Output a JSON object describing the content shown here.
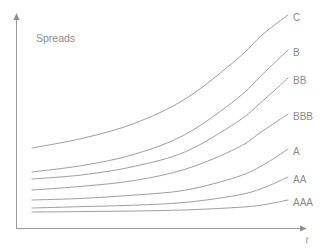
{
  "figure": {
    "title": "Spreads",
    "background_color": "#ffffff",
    "line_color": "#9e9e9e",
    "text_color": "#8b8b8b",
    "axis_color": "#9a9a9a"
  },
  "axes": {
    "x_label": "t",
    "y_label": "Spreads",
    "x_arrow": true,
    "y_arrow": true,
    "ticks": false,
    "grid": false
  },
  "chart_data": {
    "type": "line",
    "title": "Spreads",
    "xlabel": "t",
    "ylabel": "Spreads",
    "xlim": [
      0,
      1
    ],
    "ylim": [
      0,
      1
    ],
    "grid": false,
    "legend": "inline-right-labels",
    "note": "Credit spread term structures by rating; spread increases with maturity t, steeply for low ratings.",
    "series": [
      {
        "name": "C",
        "label": "C",
        "x": [
          0.0,
          0.2,
          0.4,
          0.6,
          0.8,
          0.9,
          1.0
        ],
        "y": [
          0.46,
          0.5,
          0.56,
          0.66,
          0.82,
          0.92,
          1.0
        ]
      },
      {
        "name": "B",
        "label": "B",
        "x": [
          0.0,
          0.2,
          0.4,
          0.6,
          0.8,
          0.9,
          1.0
        ],
        "y": [
          0.3,
          0.33,
          0.38,
          0.47,
          0.63,
          0.74,
          0.85
        ]
      },
      {
        "name": "BB",
        "label": "BB",
        "x": [
          0.0,
          0.2,
          0.4,
          0.6,
          0.8,
          0.9,
          1.0
        ],
        "y": [
          0.25,
          0.27,
          0.31,
          0.38,
          0.52,
          0.62,
          0.73
        ]
      },
      {
        "name": "BBB",
        "label": "BBB",
        "x": [
          0.0,
          0.2,
          0.4,
          0.6,
          0.8,
          0.9,
          1.0
        ],
        "y": [
          0.21,
          0.23,
          0.26,
          0.32,
          0.43,
          0.52,
          0.61
        ]
      },
      {
        "name": "A",
        "label": "A",
        "x": [
          0.0,
          0.2,
          0.4,
          0.6,
          0.8,
          0.9,
          1.0
        ],
        "y": [
          0.13,
          0.14,
          0.16,
          0.19,
          0.27,
          0.34,
          0.44
        ]
      },
      {
        "name": "AA",
        "label": "AA",
        "x": [
          0.0,
          0.2,
          0.4,
          0.6,
          0.8,
          0.9,
          1.0
        ],
        "y": [
          0.1,
          0.11,
          0.12,
          0.14,
          0.19,
          0.24,
          0.32
        ]
      },
      {
        "name": "AAA",
        "label": "AAA",
        "x": [
          0.0,
          0.2,
          0.4,
          0.6,
          0.8,
          0.9,
          1.0
        ],
        "y": [
          0.065,
          0.07,
          0.077,
          0.09,
          0.12,
          0.15,
          0.21
        ]
      }
    ]
  },
  "geometry": {
    "origin": {
      "x": 16,
      "y": 228
    },
    "x_axis_end": {
      "x": 307,
      "y": 228
    },
    "y_axis_top": {
      "x": 16,
      "y": 13
    },
    "curve_start_x": 32,
    "curve_end_x": 288,
    "curves": [
      {
        "name": "C",
        "y_start": 148,
        "y_end": 15,
        "label_x": 293,
        "label_y": 18
      },
      {
        "name": "B",
        "y_start": 172,
        "y_end": 50,
        "label_x": 293,
        "label_y": 53
      },
      {
        "name": "BB",
        "y_start": 179,
        "y_end": 78,
        "label_x": 293,
        "label_y": 81
      },
      {
        "name": "BBB",
        "y_start": 190,
        "y_end": 114,
        "label_x": 293,
        "label_y": 117
      },
      {
        "name": "A",
        "y_start": 200,
        "y_end": 149,
        "label_x": 293,
        "label_y": 152
      },
      {
        "name": "AA",
        "y_start": 208,
        "y_end": 177,
        "label_x": 293,
        "label_y": 180
      },
      {
        "name": "AAA",
        "y_start": 212,
        "y_end": 200,
        "label_x": 293,
        "label_y": 203
      }
    ],
    "title_pos": {
      "x": 36,
      "y": 42
    },
    "x_label_pos": {
      "x": 307,
      "y": 243
    }
  }
}
